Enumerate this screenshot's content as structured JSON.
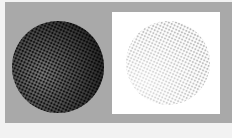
{
  "colors": {
    "background": "#a9a9a9",
    "outer": "#f2f2f2",
    "panel": "#ffffff",
    "dark_sphere": "#1a1a1a",
    "light_sphere": "#b0b0b0"
  },
  "panels": [
    {
      "name": "dark-halftone-sphere",
      "style": "dark dots on gray"
    },
    {
      "name": "light-halftone-sphere",
      "style": "light dots on white"
    }
  ]
}
